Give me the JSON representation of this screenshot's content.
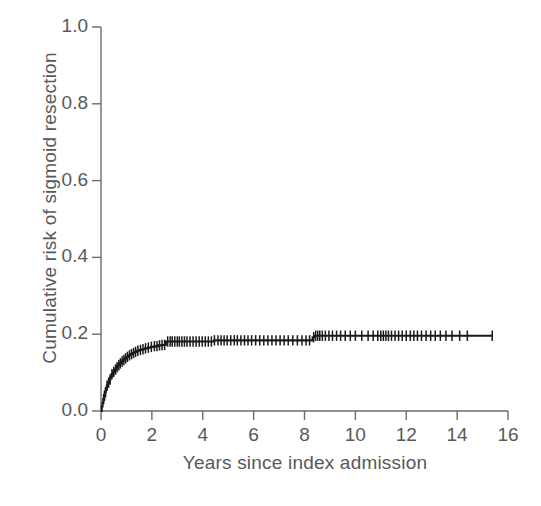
{
  "chart_data": {
    "type": "line",
    "title": "",
    "subtitle": "",
    "xlabel": "Years since index admission",
    "ylabel": "Cumulative risk of sigmoid resection",
    "xlim": [
      0,
      16
    ],
    "ylim": [
      0.0,
      1.0
    ],
    "xticks": [
      0,
      2,
      4,
      6,
      8,
      10,
      12,
      14,
      16
    ],
    "xtick_labels": [
      "0",
      "2",
      "4",
      "6",
      "8",
      "10",
      "12",
      "14",
      "16"
    ],
    "yticks": [
      0.0,
      0.2,
      0.4,
      0.6,
      0.8,
      1.0
    ],
    "ytick_labels": [
      "0.0",
      "0.2",
      "0.4",
      "0.6",
      "0.8",
      "1.0"
    ],
    "grid": false,
    "legend": null,
    "legend_position": "none",
    "line_color": "#1a1a1a",
    "axis_color": "#6b6b6b",
    "series": [
      {
        "name": "Cumulative risk of sigmoid resection",
        "style": "step",
        "marker": "censor-tick",
        "x": [
          0.0,
          0.03,
          0.06,
          0.09,
          0.12,
          0.15,
          0.19,
          0.23,
          0.27,
          0.32,
          0.37,
          0.42,
          0.48,
          0.54,
          0.6,
          0.66,
          0.72,
          0.79,
          0.86,
          0.93,
          1.0,
          1.08,
          1.16,
          1.24,
          1.33,
          1.42,
          1.52,
          1.62,
          1.73,
          1.85,
          1.97,
          2.1,
          2.24,
          2.38,
          2.52,
          2.55,
          3.2,
          3.9,
          4.4,
          4.45,
          5.2,
          6.1,
          7.0,
          7.8,
          8.25,
          8.32,
          8.4,
          9.2,
          10.1,
          11.0,
          11.9,
          12.8,
          13.7,
          14.5,
          15.4
        ],
        "y": [
          0.0,
          0.012,
          0.022,
          0.031,
          0.04,
          0.049,
          0.058,
          0.066,
          0.074,
          0.082,
          0.089,
          0.096,
          0.102,
          0.108,
          0.114,
          0.119,
          0.124,
          0.129,
          0.133,
          0.137,
          0.141,
          0.145,
          0.148,
          0.151,
          0.154,
          0.157,
          0.159,
          0.161,
          0.163,
          0.165,
          0.167,
          0.169,
          0.171,
          0.172,
          0.173,
          0.181,
          0.181,
          0.181,
          0.181,
          0.184,
          0.184,
          0.184,
          0.184,
          0.184,
          0.184,
          0.192,
          0.196,
          0.196,
          0.196,
          0.196,
          0.196,
          0.196,
          0.196,
          0.196,
          0.196
        ],
        "censor_x": [
          0.1,
          0.14,
          0.18,
          0.24,
          0.3,
          0.36,
          0.43,
          0.5,
          0.57,
          0.63,
          0.7,
          0.76,
          0.83,
          0.9,
          0.97,
          1.04,
          1.12,
          1.2,
          1.28,
          1.36,
          1.45,
          1.55,
          1.65,
          1.75,
          1.86,
          1.98,
          2.1,
          2.2,
          2.3,
          2.4,
          2.5,
          2.62,
          2.72,
          2.8,
          2.9,
          3.0,
          3.08,
          3.18,
          3.28,
          3.38,
          3.5,
          3.62,
          3.74,
          3.86,
          3.98,
          4.1,
          4.22,
          4.34,
          4.46,
          4.6,
          4.72,
          4.84,
          4.96,
          5.1,
          5.24,
          5.36,
          5.5,
          5.64,
          5.78,
          5.92,
          6.08,
          6.24,
          6.4,
          6.56,
          6.72,
          6.88,
          7.04,
          7.2,
          7.36,
          7.54,
          7.72,
          7.9,
          8.06,
          8.2,
          8.36,
          8.44,
          8.52,
          8.6,
          8.7,
          8.82,
          8.96,
          9.1,
          9.26,
          9.42,
          9.6,
          9.8,
          10.0,
          10.25,
          10.5,
          10.7,
          10.88,
          11.0,
          11.1,
          11.2,
          11.3,
          11.42,
          11.56,
          11.7,
          11.84,
          12.0,
          12.16,
          12.3,
          12.44,
          12.6,
          12.78,
          12.96,
          13.14,
          13.34,
          13.56,
          13.8,
          14.1,
          14.4,
          15.38
        ]
      }
    ],
    "annotations": [
      {
        "text": "plateau level",
        "value": 0.196,
        "x": 15.4
      }
    ]
  },
  "figure": {
    "caption": ""
  }
}
